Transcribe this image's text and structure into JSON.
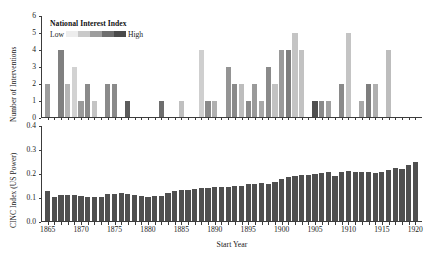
{
  "chart_data": [
    {
      "type": "bar",
      "id": "interventions",
      "title": "",
      "xlabel": "",
      "ylabel": "Number of Interventions",
      "ylim": [
        0,
        6
      ],
      "yticks": [
        "0",
        "1",
        "2",
        "3",
        "4",
        "5",
        "6"
      ],
      "ytick_values": [
        0,
        1,
        2,
        3,
        4,
        5,
        6
      ],
      "xlim": [
        1864,
        1921
      ],
      "grid": false,
      "legend": {
        "title": "National Interest Index",
        "low_label": "Low",
        "high_label": "High",
        "position": "upper-left-inside",
        "ramp_colors": [
          "#ededed",
          "#c9c9c9",
          "#9d9d9d",
          "#6e6e6e",
          "#4a4a4a"
        ]
      },
      "x": [
        1865,
        1866,
        1867,
        1868,
        1869,
        1870,
        1871,
        1872,
        1873,
        1874,
        1875,
        1876,
        1877,
        1878,
        1879,
        1880,
        1881,
        1882,
        1883,
        1884,
        1885,
        1886,
        1887,
        1888,
        1889,
        1890,
        1891,
        1892,
        1893,
        1894,
        1895,
        1896,
        1897,
        1898,
        1899,
        1900,
        1901,
        1902,
        1903,
        1904,
        1905,
        1906,
        1907,
        1908,
        1909,
        1910,
        1911,
        1912,
        1913,
        1914,
        1915,
        1916,
        1917,
        1918,
        1919,
        1920
      ],
      "values": [
        2,
        0,
        4,
        2,
        3,
        1,
        2,
        1,
        0,
        2,
        2,
        0,
        1,
        0,
        0,
        0,
        0,
        1,
        0,
        0,
        1,
        0,
        0,
        4,
        1,
        1,
        0,
        3,
        2,
        2,
        1,
        2,
        1,
        3,
        2,
        4,
        4,
        5,
        4,
        0,
        1,
        1,
        1,
        0,
        2,
        5,
        0,
        1,
        2,
        2,
        0,
        4,
        0,
        0,
        0,
        0
      ],
      "national_interest_index": [
        0.35,
        0.0,
        0.55,
        0.3,
        0.15,
        0.45,
        0.55,
        0.2,
        0.0,
        0.6,
        0.6,
        0.0,
        0.85,
        0.0,
        0.0,
        0.0,
        0.0,
        0.7,
        0.0,
        0.0,
        0.25,
        0.0,
        0.0,
        0.18,
        0.6,
        0.3,
        0.0,
        0.5,
        0.55,
        0.25,
        0.6,
        0.45,
        0.35,
        0.55,
        0.2,
        0.5,
        0.65,
        0.2,
        0.22,
        0.0,
        0.9,
        0.55,
        0.4,
        0.0,
        0.6,
        0.2,
        0.0,
        0.35,
        0.65,
        0.3,
        0.0,
        0.25,
        0.0,
        0.0,
        0.0,
        0.0
      ],
      "bar_colors": [
        "#9d9d9d",
        "#ffffff",
        "#808080",
        "#b5b5b5",
        "#d2d2d2",
        "#9a9a9a",
        "#8a8a8a",
        "#c4c4c4",
        "#ffffff",
        "#8a8a8a",
        "#8a8a8a",
        "#ffffff",
        "#5c5c5c",
        "#ffffff",
        "#ffffff",
        "#ffffff",
        "#ffffff",
        "#6e6e6e",
        "#ffffff",
        "#ffffff",
        "#c0c0c0",
        "#ffffff",
        "#ffffff",
        "#cfcfcf",
        "#8a8a8a",
        "#b0b0b0",
        "#ffffff",
        "#949494",
        "#8a8a8a",
        "#bdbdbd",
        "#8a8a8a",
        "#9a9a9a",
        "#a8a8a8",
        "#8a8a8a",
        "#c2c2c2",
        "#9a9a9a",
        "#7e7e7e",
        "#c4c4c4",
        "#c2c2c2",
        "#ffffff",
        "#4f4f4f",
        "#8a8a8a",
        "#a0a0a0",
        "#ffffff",
        "#8a8a8a",
        "#c4c4c4",
        "#ffffff",
        "#a8a8a8",
        "#7e7e7e",
        "#b0b0b0",
        "#ffffff",
        "#bdbdbd",
        "#ffffff",
        "#ffffff",
        "#ffffff",
        "#ffffff"
      ]
    },
    {
      "type": "bar",
      "id": "cinc",
      "title": "",
      "xlabel": "Start Year",
      "ylabel": "CINC Index (US Power)",
      "ylim": [
        0.0,
        0.4
      ],
      "yticks": [
        "0.0",
        "0.1",
        "0.2",
        "0.3",
        "0.4"
      ],
      "ytick_values": [
        0.0,
        0.1,
        0.2,
        0.3,
        0.4
      ],
      "xlim": [
        1864,
        1921
      ],
      "grid": false,
      "bar_color": "#4f4f4f",
      "x": [
        1865,
        1866,
        1867,
        1868,
        1869,
        1870,
        1871,
        1872,
        1873,
        1874,
        1875,
        1876,
        1877,
        1878,
        1879,
        1880,
        1881,
        1882,
        1883,
        1884,
        1885,
        1886,
        1887,
        1888,
        1889,
        1890,
        1891,
        1892,
        1893,
        1894,
        1895,
        1896,
        1897,
        1898,
        1899,
        1900,
        1901,
        1902,
        1903,
        1904,
        1905,
        1906,
        1907,
        1908,
        1909,
        1910,
        1911,
        1912,
        1913,
        1914,
        1915,
        1916,
        1917,
        1918,
        1919,
        1920
      ],
      "values": [
        0.131,
        0.104,
        0.112,
        0.113,
        0.112,
        0.11,
        0.106,
        0.103,
        0.104,
        0.115,
        0.118,
        0.119,
        0.118,
        0.113,
        0.107,
        0.106,
        0.108,
        0.11,
        0.12,
        0.131,
        0.133,
        0.132,
        0.136,
        0.14,
        0.143,
        0.145,
        0.145,
        0.147,
        0.152,
        0.152,
        0.158,
        0.16,
        0.163,
        0.16,
        0.168,
        0.181,
        0.189,
        0.193,
        0.195,
        0.196,
        0.202,
        0.205,
        0.208,
        0.193,
        0.208,
        0.211,
        0.21,
        0.207,
        0.207,
        0.204,
        0.208,
        0.215,
        0.226,
        0.222,
        0.238,
        0.252
      ]
    }
  ],
  "xaxis": {
    "title": "Start Year",
    "ticks": [
      "1865",
      "1870",
      "1875",
      "1880",
      "1885",
      "1890",
      "1895",
      "1900",
      "1905",
      "1910",
      "1915",
      "1920"
    ],
    "tick_values": [
      1865,
      1870,
      1875,
      1880,
      1885,
      1890,
      1895,
      1900,
      1905,
      1910,
      1915,
      1920
    ]
  },
  "colors": {
    "axis": "#3c3c3c",
    "text": "#1a1a1a",
    "cinc_bar": "#4f4f4f",
    "background": "#ffffff"
  }
}
